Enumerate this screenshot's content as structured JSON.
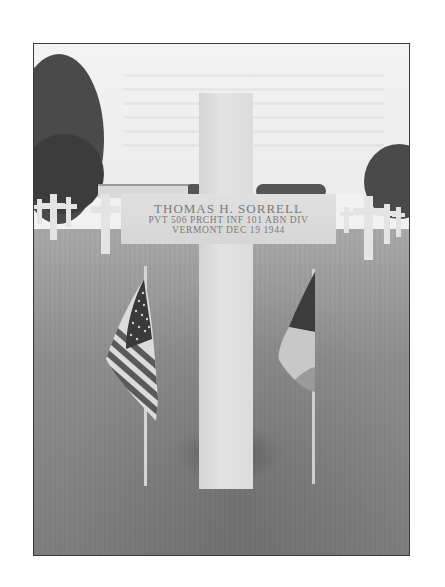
{
  "photo": {
    "description": "Black-and-white photograph of a white marble Latin cross grave marker in an American military cemetery, flanked by a small US flag (left) and a French tricolor flag (right), rows of crosses and trees in the background.",
    "headstone": {
      "name": "THOMAS H. SORRELL",
      "line2": "PVT   506 PRCHT INF   101 ABN DIV",
      "line3": "VERMONT   DEC 19 1944"
    },
    "flags": [
      {
        "position": "left",
        "type": "United States flag"
      },
      {
        "position": "right",
        "type": "French tricolor flag"
      }
    ],
    "colors": {
      "border": "#3a3a3a",
      "sky": "#f1f1f1",
      "grass": "#8e8e8e",
      "marble": "#dcdcdc",
      "inscription": "#7a7a7a"
    }
  }
}
